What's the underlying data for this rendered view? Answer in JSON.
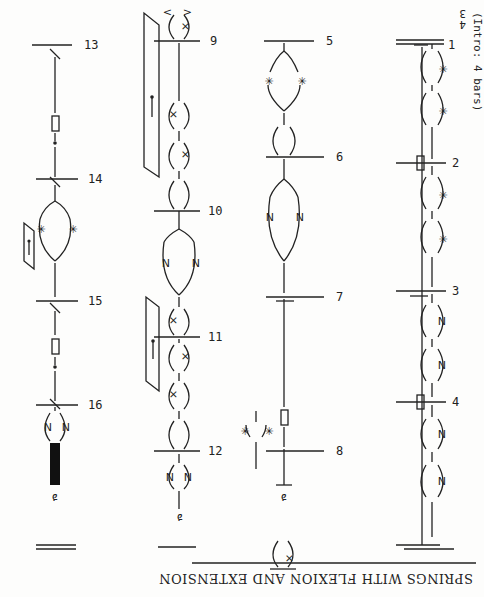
{
  "page": {
    "title": "SPRINGS WITH FLEXION AND EXTENSION",
    "intro": "(Intro: 4 bars)",
    "time_signature": {
      "top": "3",
      "bottom": "4"
    },
    "orientation": "rotated 180 degrees"
  },
  "staves": [
    {
      "id": "staff-1",
      "bars": [
        {
          "number": "1",
          "symbols": [
            "spring-star",
            "spring-star"
          ]
        },
        {
          "number": "2",
          "symbols": [
            "spring-star",
            "spring-star"
          ],
          "support": "flag"
        },
        {
          "number": "3",
          "symbols": [
            "spring-n",
            "spring-n"
          ]
        },
        {
          "number": "4",
          "symbols": [
            "spring-n",
            "spring-n"
          ],
          "support": "flag"
        }
      ]
    },
    {
      "id": "staff-2",
      "bars": [
        {
          "number": "5",
          "symbols": [
            "split-star-star",
            "loop"
          ]
        },
        {
          "number": "6",
          "symbols": [
            "split-n-n"
          ]
        },
        {
          "number": "7",
          "symbols": [
            "flag"
          ]
        },
        {
          "number": "8",
          "symbols": [
            "split-star-star",
            "figure"
          ]
        }
      ],
      "footer_symbol": "x-loop-with-arrows"
    },
    {
      "id": "staff-3",
      "bars": [
        {
          "number": "9",
          "symbols": [
            "x-loop",
            "x-loop",
            "loop"
          ],
          "bracket": "pin"
        },
        {
          "number": "10",
          "symbols": [
            "split-n-n",
            "x-loop"
          ]
        },
        {
          "number": "11",
          "symbols": [
            "x-loop",
            "x-loop",
            "loop"
          ],
          "bracket": "pin"
        },
        {
          "number": "12",
          "symbols": [
            "spring-n-n",
            "figure"
          ]
        }
      ]
    },
    {
      "id": "staff-4",
      "bars": [
        {
          "number": "13",
          "symbols": [
            "slash",
            "flag",
            "dot"
          ]
        },
        {
          "number": "14",
          "symbols": [
            "slash",
            "split-star-star"
          ],
          "bracket": "pin"
        },
        {
          "number": "15",
          "symbols": [
            "slash",
            "flag",
            "dot"
          ]
        },
        {
          "number": "16",
          "symbols": [
            "slash",
            "spring-n-n",
            "black-bar",
            "figure"
          ]
        }
      ]
    }
  ]
}
